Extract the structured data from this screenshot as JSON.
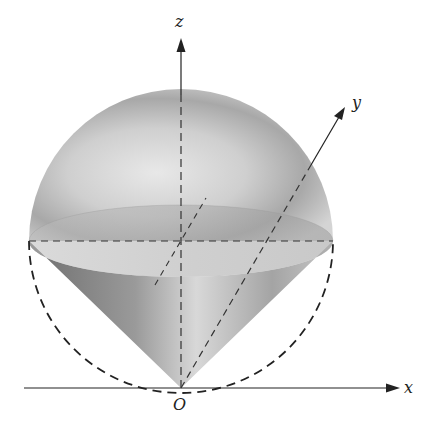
{
  "diagram": {
    "axes": {
      "x_label": "x",
      "y_label": "y",
      "z_label": "z",
      "origin_label": "O"
    },
    "colors": {
      "background": "#ffffff",
      "axis": "#222222",
      "dashed": "#333333",
      "shade_light": "#e6e6e6",
      "shade_mid": "#bdbdbd",
      "shade_dark": "#7a7a7a"
    }
  }
}
